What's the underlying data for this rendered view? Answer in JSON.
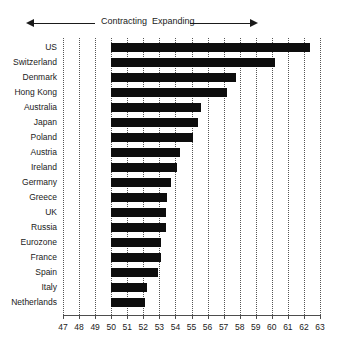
{
  "header": {
    "contracting_label": "Contracting",
    "expanding_label": "Expanding",
    "left_arrow_icon": "arrow-left-icon",
    "right_arrow_icon": "arrow-right-icon"
  },
  "chart_data": {
    "type": "bar",
    "orientation": "horizontal",
    "title": "",
    "xlabel": "",
    "ylabel": "",
    "xlim": [
      47,
      63
    ],
    "baseline": 50,
    "grid": true,
    "gridline_style": "dotted",
    "legend": "none",
    "bar_color": "#0d0d0d",
    "annotations": [
      "Contracting",
      "Expanding"
    ],
    "xticks": [
      47,
      48,
      49,
      50,
      51,
      52,
      53,
      54,
      55,
      56,
      57,
      58,
      59,
      60,
      61,
      62,
      63
    ],
    "categories": [
      "US",
      "Switzerland",
      "Denmark",
      "Hong Kong",
      "Australia",
      "Japan",
      "Poland",
      "Austria",
      "Ireland",
      "Germany",
      "Greece",
      "UK",
      "Russia",
      "Eurozone",
      "France",
      "Spain",
      "Italy",
      "Netherlands"
    ],
    "values": [
      62.4,
      60.2,
      57.8,
      57.2,
      55.6,
      55.4,
      55.1,
      54.3,
      54.1,
      53.7,
      53.5,
      53.4,
      53.4,
      53.1,
      53.1,
      52.9,
      52.2,
      52.1
    ]
  }
}
